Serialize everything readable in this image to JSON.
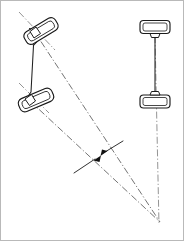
{
  "diagram": {
    "canvas": {
      "width": 184,
      "height": 241,
      "background": "#ffffff"
    },
    "colors": {
      "outline": "#1a1a1a",
      "linkage": "#202020",
      "chain_line": "#8e8e8e",
      "chain_line_dark": "#6d6d6d",
      "frame": "#b9b9b9",
      "arrow_fill": "#111111"
    },
    "components": {
      "front_outer_wheel": {
        "name": "front-left-steered-wheel",
        "shape": "rounded-rectangle",
        "center": [
          41,
          31
        ],
        "length": 36,
        "width": 14,
        "rotation_deg": -31
      },
      "front_inner_wheel": {
        "name": "front-right-steered-wheel",
        "shape": "rounded-rectangle",
        "center": [
          36,
          100
        ],
        "length": 36,
        "width": 14,
        "rotation_deg": -23
      },
      "rear_top_wheel": {
        "name": "rear-top-wheel",
        "shape": "rounded-rectangle",
        "center": [
          155,
          27
        ],
        "length": 30,
        "width": 13,
        "rotation_deg": 0
      },
      "rear_bottom_wheel": {
        "name": "rear-bottom-wheel",
        "shape": "rounded-rectangle",
        "center": [
          155,
          101
        ],
        "length": 30,
        "width": 13,
        "rotation_deg": 0
      },
      "rear_axle": {
        "name": "rear-axle-beam",
        "from": [
          155,
          36
        ],
        "to": [
          155,
          93
        ]
      },
      "steering_linkage": {
        "name": "steering-tie-rod-linkage",
        "description": "trapezoidal steering arm and tie rod assembly joining both steered wheels",
        "vertices": [
          [
            30,
            29
          ],
          [
            44,
            33
          ],
          [
            34,
            46
          ],
          [
            31,
            92
          ],
          [
            26,
            99
          ]
        ]
      },
      "turn_center": {
        "name": "instantaneous-turn-center",
        "position": [
          160,
          222
        ]
      }
    },
    "projection_lines": [
      {
        "name": "front-outer-wheel-axis",
        "from": [
          19,
          12
        ],
        "to": [
          53,
          48
        ]
      },
      {
        "name": "front-outer-steer-radius",
        "from": [
          34,
          32
        ],
        "to": [
          160,
          222
        ]
      },
      {
        "name": "front-inner-wheel-axis",
        "from": [
          19,
          83
        ],
        "to": [
          47,
          111
        ]
      },
      {
        "name": "front-inner-steer-radius",
        "from": [
          30,
          101
        ],
        "to": [
          160,
          222
        ]
      },
      {
        "name": "rear-axle-centerline",
        "from": [
          155,
          36
        ],
        "to": [
          158,
          222
        ]
      }
    ],
    "dimension": {
      "name": "offset-dimension-indicator",
      "description": "double arrowhead dimension marking the gap between the two steer-radius chain lines",
      "leader": {
        "from": [
          75,
          172
        ],
        "to": [
          122,
          142
        ]
      },
      "arrowheads": [
        {
          "at": [
            93,
            160
          ],
          "direction": "down-left"
        },
        {
          "at": [
            107,
            151
          ],
          "direction": "up-right"
        }
      ]
    }
  }
}
